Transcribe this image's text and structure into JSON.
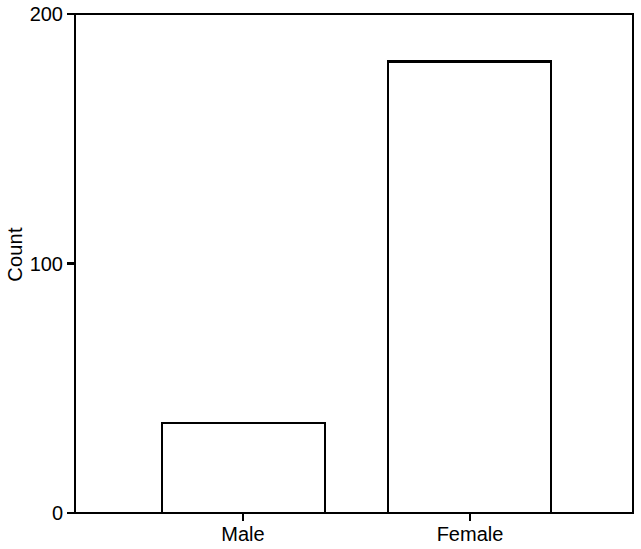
{
  "chart_data": {
    "type": "bar",
    "title": "",
    "subtitle": "",
    "xlabel": "",
    "ylabel": "Count",
    "categories": [
      "Male",
      "Female"
    ],
    "values": [
      36,
      181
    ],
    "series": [
      {
        "name": "Count",
        "values": [
          36,
          181
        ]
      }
    ],
    "ylim": [
      0,
      200
    ],
    "ytick_values": [
      0,
      100,
      200
    ],
    "ytick_labels": [
      "0",
      "100",
      "200"
    ],
    "xtick_labels": [
      "Male",
      "Female"
    ],
    "grid": false,
    "legend": false,
    "legend_position": "none",
    "bar_fill_color": "#FFFFFF",
    "bar_edge_color": "#000000",
    "axis_color": "#000000",
    "background_color": "#FFFFFF",
    "annotations": []
  },
  "geometry": {
    "plot_left": 75,
    "plot_right": 633,
    "plot_top": 14,
    "plot_bottom": 513,
    "bars": [
      {
        "label": "Male",
        "x0": 162,
        "x1": 325,
        "top": 423,
        "center": 243
      },
      {
        "label": "Female",
        "x0": 388,
        "x1": 551,
        "top": 60,
        "center": 470
      }
    ],
    "ytick_y": [
      513,
      264,
      14
    ],
    "xlabel_y": 522
  }
}
